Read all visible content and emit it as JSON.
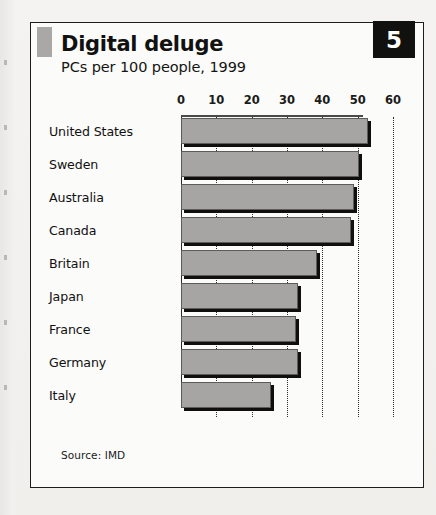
{
  "panel": {
    "badge_number": "5",
    "title": "Digital deluge",
    "subtitle": "PCs per 100 people, 1999",
    "source": "Source: IMD",
    "accent_color": "#a9a8a6",
    "badge_bg": "#111110",
    "badge_fg": "#ffffff",
    "bar_fill": "#a6a5a3",
    "bar_shadow": "#100f0e",
    "panel_border": "#1d1d1b"
  },
  "chart_data": {
    "type": "bar",
    "orientation": "horizontal",
    "title": "Digital deluge",
    "subtitle": "PCs per 100 people, 1999",
    "xlabel": "",
    "ylabel": "",
    "xlim": [
      0,
      60
    ],
    "xticks": [
      0,
      10,
      20,
      30,
      40,
      50,
      60
    ],
    "xtick_labels": [
      "0",
      "10",
      "20",
      "30",
      "40",
      "50",
      "60"
    ],
    "grid": "vertical-dotted",
    "legend": "none",
    "source": "Source: IMD",
    "categories": [
      "United States",
      "Sweden",
      "Australia",
      "Canada",
      "Britain",
      "Japan",
      "France",
      "Germany",
      "Italy"
    ],
    "values": [
      53,
      50.5,
      49,
      48,
      38.5,
      33,
      32.5,
      33,
      25.5
    ]
  }
}
